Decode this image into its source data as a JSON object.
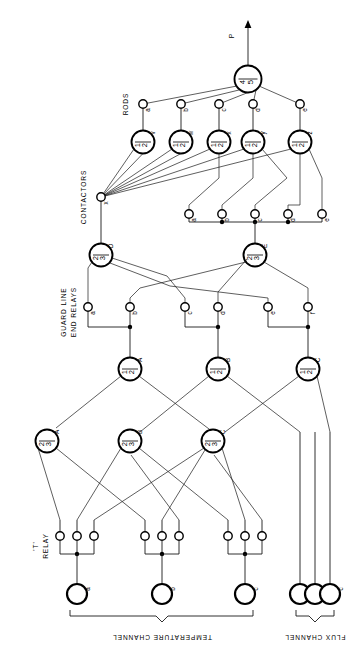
{
  "diagram": {
    "orientation_note": "all text rotated 90 degrees counter-clockwise",
    "output_label": "P",
    "section_labels": {
      "rods": "RODS",
      "contactors": "CONTACTORS",
      "guard_line": "GUARD LINE",
      "end_relays": "END RELAYS",
      "t_relay_line1": "'T'",
      "t_relay_line2": "RELAY",
      "temperature_channel": "TEMPERATURE CHANNEL",
      "flux_channel": "FLUX CHANNEL"
    },
    "gates": {
      "top": {
        "label": "4/5",
        "name": ""
      },
      "rod_gates": [
        {
          "label": "1/2",
          "name": "v"
        },
        {
          "label": "1/2",
          "name": "w"
        },
        {
          "label": "1/2",
          "name": "x"
        },
        {
          "label": "1/2",
          "name": "y"
        },
        {
          "label": "1/2",
          "name": "z"
        }
      ],
      "guard_gates": [
        {
          "label": "2/3",
          "name": "D"
        },
        {
          "label": "2/3",
          "name": "E"
        }
      ],
      "mid_gates": [
        {
          "label": "1/2",
          "name": "A"
        },
        {
          "label": "1/2",
          "name": "B"
        },
        {
          "label": "1/2",
          "name": "C"
        }
      ],
      "low_gates": [
        {
          "label": "2/3",
          "name": "A"
        },
        {
          "label": "2/3",
          "name": "B"
        },
        {
          "label": "2/3",
          "name": "C"
        }
      ]
    },
    "nodes": {
      "rods": [
        "a",
        "b",
        "c",
        "d",
        "e"
      ],
      "contactors": [
        "a",
        "b",
        "c",
        "d",
        "e"
      ],
      "guard_relays": [
        "a",
        "b",
        "c",
        "d",
        "e",
        "f"
      ],
      "t_relay": [
        "",
        "",
        "",
        "",
        "",
        "",
        "",
        "",
        ""
      ],
      "temperature_channel": [
        "a",
        "b",
        "c"
      ],
      "flux_channel": [
        "a",
        "b",
        "c"
      ]
    }
  }
}
